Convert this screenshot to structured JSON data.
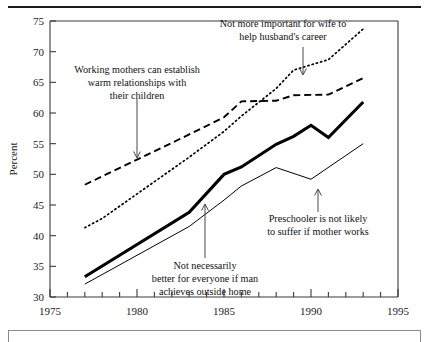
{
  "chart_data": {
    "type": "line",
    "title": "",
    "xlabel": "",
    "ylabel": "Percent",
    "xlim": [
      1975,
      1995
    ],
    "ylim": [
      30,
      75
    ],
    "xticks": [
      1975,
      1976,
      1977,
      1978,
      1979,
      1980,
      1981,
      1982,
      1983,
      1984,
      1985,
      1986,
      1987,
      1988,
      1989,
      1990,
      1991,
      1992,
      1993,
      1994,
      1995
    ],
    "xtick_labels": [
      "1975",
      "",
      "",
      "",
      "",
      "1980",
      "",
      "",
      "",
      "",
      "1985",
      "",
      "",
      "",
      "",
      "1990",
      "",
      "",
      "",
      "",
      "1995"
    ],
    "yticks": [
      30,
      35,
      40,
      45,
      50,
      55,
      60,
      65,
      70,
      75
    ],
    "ytick_labels": [
      "30",
      "35",
      "40",
      "45",
      "50",
      "55",
      "60",
      "65",
      "70",
      "75"
    ],
    "grid": false,
    "legend": "annotations-with-arrows",
    "series": [
      {
        "name": "Not more important for wife to help husband's career",
        "style": "dotted",
        "x": [
          1977,
          1978,
          1983,
          1985,
          1986,
          1988,
          1989,
          1991,
          1993
        ],
        "values": [
          41.3,
          42.8,
          52.8,
          57.0,
          59.5,
          64.0,
          67.0,
          68.7,
          73.7
        ]
      },
      {
        "name": "Working mothers can establish warm relationships with their children",
        "style": "dashed",
        "x": [
          1977,
          1983,
          1985,
          1986,
          1988,
          1989,
          1991,
          1993
        ],
        "values": [
          48.3,
          56.5,
          59.3,
          61.9,
          62.0,
          62.9,
          63.0,
          65.7
        ]
      },
      {
        "name": "Not necessarily better for everyone if man achieves outside home",
        "style": "thick-solid",
        "x": [
          1977,
          1983,
          1985,
          1986,
          1988,
          1989,
          1990,
          1991,
          1993
        ],
        "values": [
          33.3,
          43.8,
          50.0,
          51.2,
          54.9,
          56.2,
          58.0,
          56.0,
          61.8
        ]
      },
      {
        "name": "Preschooler is not likely to suffer if mother works",
        "style": "thin-solid",
        "x": [
          1977,
          1983,
          1985,
          1986,
          1988,
          1990,
          1993
        ],
        "values": [
          32.1,
          41.5,
          45.8,
          48.1,
          51.1,
          49.2,
          55.0
        ]
      }
    ],
    "annotations": [
      {
        "id": "annot-wife-career",
        "lines": [
          "Not more important for wife to",
          "help husband's career"
        ],
        "target_series": "Not more important for wife to help husband's career",
        "arrow": "down"
      },
      {
        "id": "annot-working-mothers",
        "lines": [
          "Working mothers can establish",
          "warm relationships with",
          "their children"
        ],
        "target_series": "Working mothers can establish warm relationships with their children",
        "arrow": "down"
      },
      {
        "id": "annot-preschooler",
        "lines": [
          "Preschooler is not likely",
          "to suffer if mother works"
        ],
        "target_series": "Preschooler is not likely to suffer if mother works",
        "arrow": "up"
      },
      {
        "id": "annot-man-achieves",
        "lines": [
          "Not necessarily",
          "better for everyone if man",
          "achieves outside home"
        ],
        "target_series": "Not necessarily better for everyone if man achieves outside home",
        "arrow": "up"
      }
    ]
  },
  "axis": {
    "y_title": "Percent"
  }
}
